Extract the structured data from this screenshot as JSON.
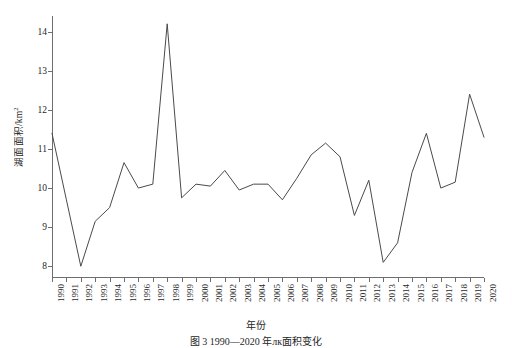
{
  "figure": {
    "caption": "图 3  1990—2020 年лк面积变化"
  },
  "chart_data": {
    "type": "line",
    "title": "",
    "xlabel": "年份",
    "ylabel": "湖面面积/km2",
    "ylabel_text": "湖面面积/km",
    "ylabel_sup": "2",
    "grid": false,
    "legend": "none",
    "xlim": [
      1990,
      2020
    ],
    "ylim": [
      7.7,
      14.4
    ],
    "yticks": [
      8,
      9,
      10,
      11,
      12,
      13,
      14
    ],
    "ytick_labels": [
      "8",
      "9",
      "10",
      "11",
      "12",
      "13",
      "14"
    ],
    "line_color": "#4a4a4a",
    "line_width": 1,
    "categories": [
      "1990",
      "1991",
      "1992",
      "1993",
      "1994",
      "1995",
      "1996",
      "1997",
      "1998",
      "1999",
      "2000",
      "2001",
      "2002",
      "2003",
      "2004",
      "2005",
      "2006",
      "2007",
      "2008",
      "2009",
      "2010",
      "2011",
      "2012",
      "2013",
      "2014",
      "2015",
      "2016",
      "2017",
      "2018",
      "2019",
      "2020"
    ],
    "x": [
      1990,
      1991,
      1992,
      1993,
      1994,
      1995,
      1996,
      1997,
      1998,
      1999,
      2000,
      2001,
      2002,
      2003,
      2004,
      2005,
      2006,
      2007,
      2008,
      2009,
      2010,
      2011,
      2012,
      2013,
      2014,
      2015,
      2016,
      2017,
      2018,
      2019,
      2020
    ],
    "values": [
      11.4,
      9.7,
      8.0,
      9.15,
      9.5,
      10.65,
      10.0,
      10.1,
      14.2,
      9.75,
      10.1,
      10.05,
      10.45,
      9.95,
      10.1,
      10.1,
      9.7,
      10.25,
      10.85,
      11.15,
      10.8,
      9.3,
      10.2,
      8.1,
      8.6,
      10.4,
      11.4,
      10.0,
      10.15,
      12.4,
      11.3
    ]
  }
}
